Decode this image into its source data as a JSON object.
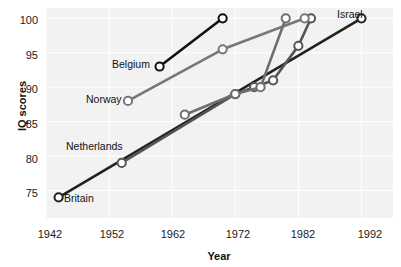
{
  "chart_data": {
    "type": "line",
    "title": "",
    "xlabel": "Year",
    "ylabel": "IQ scores",
    "xlim": [
      1942,
      1997
    ],
    "ylim": [
      71,
      101.5
    ],
    "xticks": [
      1942,
      1952,
      1962,
      1972,
      1982,
      1992
    ],
    "yticks": [
      75,
      80,
      85,
      90,
      95,
      100
    ],
    "grid": true,
    "legend_position": "inline-labels",
    "background_color": "#f2f2f2",
    "series": [
      {
        "name": "Britain",
        "color": "#222222",
        "label_position": "start-right",
        "points": [
          {
            "x": 1944,
            "y": 74
          },
          {
            "x": 1992,
            "y": 100
          }
        ]
      },
      {
        "name": "Netherlands",
        "color": "#555555",
        "label_position": "above-start",
        "points": [
          {
            "x": 1954,
            "y": 79
          },
          {
            "x": 1972,
            "y": 89
          },
          {
            "x": 1975,
            "y": 90
          },
          {
            "x": 1978,
            "y": 91
          },
          {
            "x": 1982,
            "y": 96
          },
          {
            "x": 1984,
            "y": 100
          }
        ]
      },
      {
        "name": "Norway",
        "color": "#777777",
        "label_position": "left",
        "points": [
          {
            "x": 1955,
            "y": 88
          },
          {
            "x": 1970,
            "y": 95.5
          },
          {
            "x": 1983,
            "y": 100
          }
        ]
      },
      {
        "name": "Belgium",
        "color": "#111111",
        "label_position": "left",
        "points": [
          {
            "x": 1960,
            "y": 93
          },
          {
            "x": 1970,
            "y": 100
          }
        ]
      },
      {
        "name": "Israel",
        "color": "#6e6e6e",
        "label_position": "above-end",
        "points": [
          {
            "x": 1964,
            "y": 86
          },
          {
            "x": 1972,
            "y": 89
          },
          {
            "x": 1976,
            "y": 90
          },
          {
            "x": 1980,
            "y": 100
          }
        ]
      }
    ]
  },
  "labels": {
    "y_100": "100",
    "y_95": "95",
    "y_90": "90",
    "y_85": "85",
    "y_80": "80",
    "y_75": "75",
    "x_1942": "1942",
    "x_1952": "1952",
    "x_1962": "1962",
    "x_1972": "1972",
    "x_1982": "1982",
    "x_1992": "1992",
    "axis_x_title": "Year",
    "axis_y_title": "IQ scores",
    "s_britain": "Britain",
    "s_netherlands": "Netherlands",
    "s_norway": "Norway",
    "s_belgium": "Belgium",
    "s_israel": "Israel"
  }
}
